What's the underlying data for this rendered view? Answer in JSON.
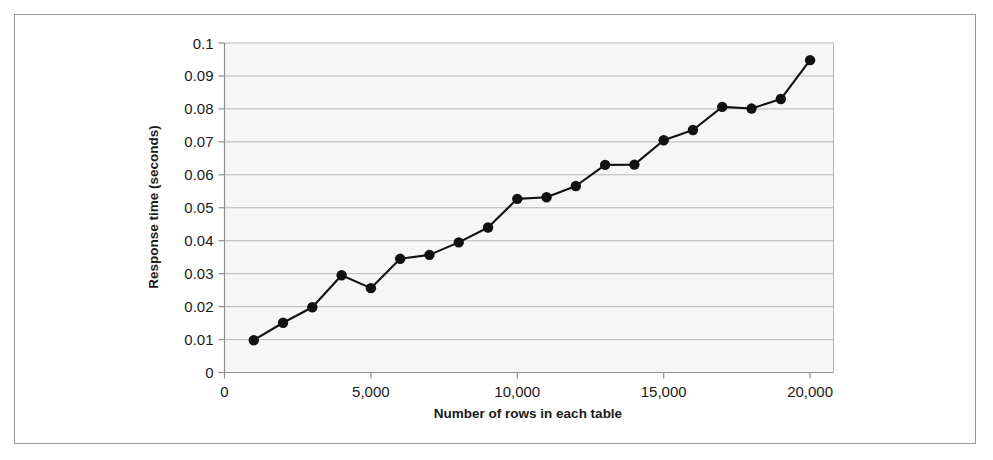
{
  "figure": {
    "background_color": "#ffffff",
    "frame_color": "#9a9a9a",
    "plot_background_color": "#f6f6f6",
    "gridline_color": "#b8b8b8",
    "axis_color": "#8f8f8f",
    "series_color": "#111111"
  },
  "chart_data": {
    "type": "line",
    "title": "",
    "xlabel": "Number of rows in each table",
    "ylabel": "Response time (seconds)",
    "xlim": [
      0,
      20800
    ],
    "ylim": [
      0,
      0.1
    ],
    "grid": true,
    "grid_axis": "y",
    "legend": false,
    "legend_position": "none",
    "marker": "filled-circle",
    "x_tick_labels": [
      "0",
      "5,000",
      "10,000",
      "15,000",
      "20,000"
    ],
    "x_tick_values": [
      0,
      5000,
      10000,
      15000,
      20000
    ],
    "y_tick_labels": [
      "0",
      "0.01",
      "0.02",
      "0.03",
      "0.04",
      "0.05",
      "0.06",
      "0.07",
      "0.08",
      "0.09",
      "0.1"
    ],
    "y_tick_values": [
      0,
      0.01,
      0.02,
      0.03,
      0.04,
      0.05,
      0.06,
      0.07,
      0.08,
      0.09,
      0.1
    ],
    "x": [
      1000,
      2000,
      3000,
      4000,
      5000,
      6000,
      7000,
      8000,
      9000,
      10000,
      11000,
      12000,
      13000,
      14000,
      15000,
      16000,
      17000,
      18000,
      19000,
      20000
    ],
    "values": [
      0.0098,
      0.0151,
      0.0198,
      0.0295,
      0.0256,
      0.0345,
      0.0357,
      0.0395,
      0.044,
      0.0527,
      0.0532,
      0.0566,
      0.063,
      0.0631,
      0.0705,
      0.0736,
      0.0806,
      0.0801,
      0.083,
      0.0948
    ],
    "series": [
      {
        "name": "Response time",
        "values": [
          0.0098,
          0.0151,
          0.0198,
          0.0295,
          0.0256,
          0.0345,
          0.0357,
          0.0395,
          0.044,
          0.0527,
          0.0532,
          0.0566,
          0.063,
          0.0631,
          0.0705,
          0.0736,
          0.0806,
          0.0801,
          0.083,
          0.0948
        ]
      }
    ]
  }
}
